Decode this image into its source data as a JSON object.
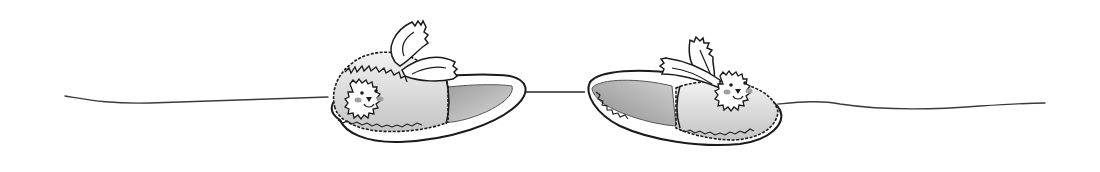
{
  "illustration": {
    "description": "Pencil-and-ink sketch of a pair of bunny slippers resting on a thin horizontal line",
    "subject": "bunny slippers",
    "count": 2,
    "style": "grayscale hand-drawn",
    "colors": {
      "background": "#ffffff",
      "ink": "#1a1a1a",
      "shade_light": "#d6d6d6",
      "shade_mid": "#a8a8a8",
      "shade_dark": "#8a8a8a",
      "cheek": "#9a9a9a"
    },
    "items": [
      {
        "name": "left-slipper",
        "facing": "left",
        "face": "bunny"
      },
      {
        "name": "right-slipper",
        "facing": "right",
        "face": "bunny"
      }
    ]
  }
}
